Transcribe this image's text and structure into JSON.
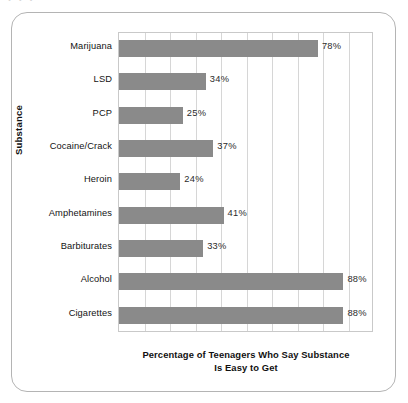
{
  "figure": {
    "top_artifact_text": "·  ·  ·",
    "frame_color": "#b4b4b4",
    "background": "#ffffff"
  },
  "chart_data": {
    "type": "bar",
    "orientation": "horizontal",
    "title": "",
    "subtitle": "",
    "xlabel": "Percentage of Teenagers Who Say Substance Is Easy to Get",
    "xlabel_lines": [
      "Percentage of Teenagers Who Say Substance",
      "Is Easy to Get"
    ],
    "ylabel": "Substance",
    "categories": [
      "Marijuana",
      "LSD",
      "PCP",
      "Cocaine/Crack",
      "Heroin",
      "Amphetamines",
      "Barbiturates",
      "Alcohol",
      "Cigarettes"
    ],
    "values": [
      78,
      34,
      25,
      37,
      24,
      41,
      33,
      88,
      88
    ],
    "data_labels": [
      "78%",
      "34%",
      "25%",
      "37%",
      "24%",
      "41%",
      "33%",
      "88%",
      "88%"
    ],
    "xlim": [
      0,
      100
    ],
    "xtick_interval": 10,
    "xticklabels": [],
    "grid": "vertical",
    "legend": "none",
    "bar_color": "#8a8a8a",
    "gridline_color": "#d6d6d6",
    "axis_color": "#c9c9c9"
  }
}
